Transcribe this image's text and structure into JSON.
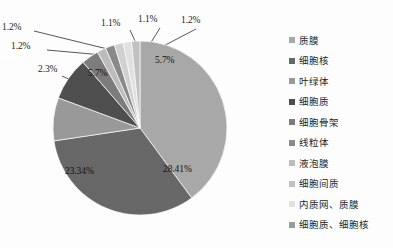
{
  "chart_data": {
    "type": "pie",
    "title": "",
    "subtitle": "",
    "xlabel": "",
    "ylabel": "",
    "grid": false,
    "legend_position": "right",
    "start_angle_deg": 0,
    "direction": "clockwise",
    "categories": [
      "质膜",
      "细胞核",
      "叶绿体",
      "细胞质",
      "细胞骨架",
      "线粒体",
      "液泡膜",
      "细胞间质",
      "内质网、质膜",
      "细胞质、细胞核"
    ],
    "values": [
      28.41,
      23.34,
      5.7,
      5.7,
      2.3,
      1.2,
      1.2,
      1.2,
      1.1,
      1.1
    ],
    "colors": [
      "#a9a9a9",
      "#686868",
      "#9a9a9a",
      "#4f4f4f",
      "#7d7d7d",
      "#bdbdbd",
      "#8a8a8a",
      "#d2d2d2",
      "#e2e2e2",
      "#c2c2c2"
    ],
    "slices": [
      {
        "label": "质膜",
        "value": 28.41,
        "display": "28.41%",
        "color": "#a9a9a9"
      },
      {
        "label": "细胞核",
        "value": 23.34,
        "display": "23.34%",
        "color": "#686868"
      },
      {
        "label": "叶绿体",
        "value": 5.7,
        "display": "5.7%",
        "color": "#9a9a9a"
      },
      {
        "label": "细胞质",
        "value": 5.7,
        "display": "5.7%",
        "color": "#4f4f4f"
      },
      {
        "label": "细胞骨架",
        "value": 2.3,
        "display": "2.3%",
        "color": "#7d7d7d"
      },
      {
        "label": "线粒体",
        "value": 1.2,
        "display": "1.2%",
        "color": "#bdbdbd"
      },
      {
        "label": "液泡膜",
        "value": 1.2,
        "display": "1.2%",
        "color": "#8a8a8a"
      },
      {
        "label": "细胞间质",
        "value": 1.2,
        "display": "1.2%",
        "color": "#d2d2d2"
      },
      {
        "label": "内质网、质膜",
        "value": 1.1,
        "display": "1.1%",
        "color": "#e2e2e2"
      },
      {
        "label": "细胞质、细胞核",
        "value": 1.1,
        "display": "1.1%",
        "color": "#c2c2c2"
      }
    ]
  },
  "labels": {
    "big_right": "28.41%",
    "big_left": "23.34%",
    "dark_top_right": "5.7%",
    "mid_top_left": "5.7%",
    "leader_left_lower": "2.3%",
    "leader_left_upper": "1.2%",
    "leader_left_top": "1.2%",
    "leader_top_mid_left": "1.1%",
    "leader_top_mid": "1.1%",
    "leader_top_right": "1.2%"
  },
  "legend": {
    "items": [
      {
        "label": "质膜",
        "color": "#a9a9a9"
      },
      {
        "label": "细胞核",
        "color": "#686868"
      },
      {
        "label": "叶绿体",
        "color": "#9a9a9a"
      },
      {
        "label": "细胞质",
        "color": "#4f4f4f"
      },
      {
        "label": "细胞骨架",
        "color": "#7d7d7d"
      },
      {
        "label": "线粒体",
        "color": "#8a8a8a"
      },
      {
        "label": "液泡膜",
        "color": "#bdbdbd"
      },
      {
        "label": "细胞间质",
        "color": "#c2c2c2"
      },
      {
        "label": "内质网、质膜",
        "color": "#e2e2e2"
      },
      {
        "label": "细胞质、细胞核",
        "color": "#9c9c9c"
      }
    ]
  }
}
